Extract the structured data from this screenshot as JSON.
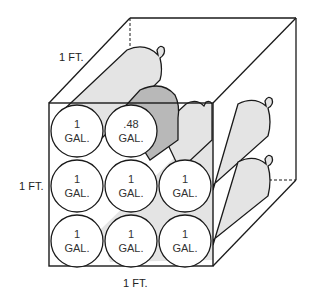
{
  "diagram": {
    "dimension_labels": {
      "depth": "1 FT.",
      "height": "1 FT.",
      "width": "1 FT."
    },
    "jugs": [
      {
        "row": 0,
        "col": 0,
        "volume": "1",
        "unit": "GAL."
      },
      {
        "row": 0,
        "col": 1,
        "volume": ".48",
        "unit": "GAL."
      },
      {
        "row": 1,
        "col": 0,
        "volume": "1",
        "unit": "GAL."
      },
      {
        "row": 1,
        "col": 1,
        "volume": "1",
        "unit": "GAL."
      },
      {
        "row": 1,
        "col": 2,
        "volume": "1",
        "unit": "GAL."
      },
      {
        "row": 2,
        "col": 0,
        "volume": "1",
        "unit": "GAL."
      },
      {
        "row": 2,
        "col": 1,
        "volume": "1",
        "unit": "GAL."
      },
      {
        "row": 2,
        "col": 2,
        "volume": "1",
        "unit": "GAL."
      }
    ],
    "colors": {
      "outline": "#1a1a1a",
      "jug_body": "#e4e4e4",
      "partial_jug": "#b8b8b8",
      "jug_face": "#ffffff"
    }
  }
}
